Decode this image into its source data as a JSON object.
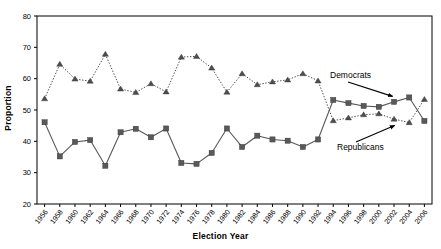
{
  "chart_data": {
    "type": "line",
    "title": "",
    "xlabel": "Election Year",
    "ylabel": "Proportion",
    "ylim": [
      20,
      80
    ],
    "yticks": [
      20,
      30,
      40,
      50,
      60,
      70,
      80
    ],
    "grid": false,
    "legend_position": "inline-annotations",
    "categories": [
      1956,
      1958,
      1960,
      1962,
      1964,
      1966,
      1968,
      1970,
      1972,
      1974,
      1976,
      1978,
      1980,
      1982,
      1984,
      1986,
      1988,
      1990,
      1992,
      1994,
      1996,
      1998,
      2000,
      2002,
      2004,
      2006
    ],
    "xtick_labels": [
      "1956",
      "1958",
      "1960",
      "1962",
      "1964",
      "1966",
      "1968",
      "1970",
      "1972",
      "1974",
      "1976",
      "1978",
      "1980",
      "1982",
      "1984",
      "1986",
      "1988",
      "1990",
      "1992",
      "1994",
      "1996",
      "1998",
      "2000",
      "2002",
      "2004",
      "2006"
    ],
    "series": [
      {
        "name": "Democrats",
        "marker": "square",
        "linestyle": "solid",
        "color": "#595959",
        "values": [
          46.1,
          35.2,
          39.8,
          40.4,
          32.2,
          42.9,
          44.0,
          41.3,
          44.1,
          33.1,
          32.8,
          36.3,
          44.1,
          38.2,
          41.8,
          40.6,
          40.2,
          38.2,
          40.6,
          53.2,
          52.2,
          51.3,
          51.0,
          52.6,
          54.0,
          46.5
        ]
      },
      {
        "name": "Republicans",
        "marker": "triangle",
        "linestyle": "dotted",
        "color": "#4d4d4d",
        "values": [
          53.6,
          64.6,
          59.9,
          59.2,
          67.8,
          56.7,
          55.6,
          58.4,
          55.8,
          66.9,
          67.1,
          63.4,
          55.7,
          61.6,
          58.1,
          59.0,
          59.6,
          61.6,
          59.3,
          46.6,
          47.5,
          48.5,
          48.8,
          47.1,
          46.0,
          53.4
        ]
      }
    ],
    "annotations": [
      {
        "label": "Democrats",
        "points_to_series": "Democrats",
        "points_to_x": 2002
      },
      {
        "label": "Republicans",
        "points_to_series": "Republicans",
        "points_to_x": 2002
      }
    ]
  }
}
